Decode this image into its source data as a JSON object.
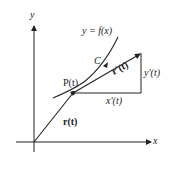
{
  "diagram": {
    "axes": {
      "x_label": "x",
      "y_label": "y"
    },
    "curve": {
      "equation": "y = f(x)",
      "name": "C"
    },
    "point": {
      "label": "P(t)"
    },
    "vectors": {
      "position": "r(t)",
      "tangent": "r'(t)"
    },
    "components": {
      "horizontal": "x'(t)",
      "vertical": "y'(t)"
    },
    "colors": {
      "stroke": "#222222",
      "background": "#ffffff"
    }
  }
}
